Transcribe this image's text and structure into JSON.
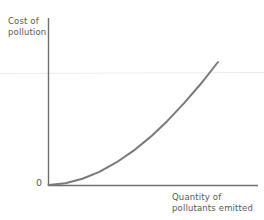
{
  "chart_data": {
    "type": "line",
    "title": "",
    "subtitle": "",
    "xlabel": "Quantity of pollutants emitted",
    "ylabel": "Cost of pollution",
    "origin_label": "0",
    "grid": false,
    "legend": false,
    "legend_position": "none",
    "xlim": [
      0,
      1
    ],
    "ylim": [
      0,
      1
    ],
    "x_tick_labels": [],
    "y_tick_labels": [],
    "annotations": [],
    "series": [
      {
        "name": "Cost of pollution curve",
        "shape": "convex increasing power curve",
        "exponent": 1.85,
        "color": "#7a7a7a",
        "line_width": 2,
        "x": [
          0,
          0.1,
          0.2,
          0.3,
          0.4,
          0.5,
          0.6,
          0.7,
          0.8,
          0.9,
          1
        ],
        "values": [
          0,
          0.014,
          0.051,
          0.107,
          0.183,
          0.277,
          0.389,
          0.519,
          0.666,
          0.825,
          1
        ]
      }
    ]
  },
  "figure": {
    "background_color": "#ffffff",
    "axis_color": "#6e6e6e",
    "text_color": "#58595b",
    "curve_color": "#7a7a7a"
  }
}
